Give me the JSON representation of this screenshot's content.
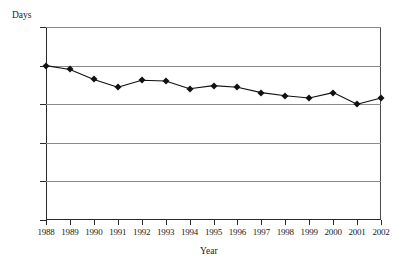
{
  "chart_data": {
    "type": "line",
    "title": "",
    "xlabel": "Year",
    "ylabel": "Days",
    "categories": [
      "1988",
      "1989",
      "1990",
      "1991",
      "1992",
      "1993",
      "1994",
      "1995",
      "1996",
      "1997",
      "1998",
      "1999",
      "2000",
      "2001",
      "2002"
    ],
    "values": [
      200,
      195,
      182,
      172,
      181,
      180,
      170,
      174,
      172,
      165,
      161,
      158,
      165,
      150,
      158
    ],
    "series": [
      {
        "name": "Days",
        "values": [
          200,
          195,
          182,
          172,
          181,
          180,
          170,
          174,
          172,
          165,
          161,
          158,
          165,
          150,
          158
        ]
      }
    ],
    "ylim": [
      0,
      250
    ],
    "yticks": [
      0,
      50,
      100,
      150,
      200,
      250
    ],
    "ytick_labels": [
      "0",
      "50",
      "100",
      "150",
      "200",
      "250"
    ],
    "grid": true,
    "legend": "none",
    "line_color": "#111111",
    "marker": "diamond",
    "marker_color": "#111111",
    "grid_color": "#8a8a8a",
    "axis_color": "#2a2a2a",
    "background": "#ffffff"
  },
  "axes": {
    "y_title": "Days",
    "x_title": "Year"
  }
}
